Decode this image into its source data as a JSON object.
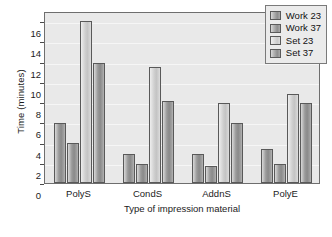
{
  "chart_data": {
    "type": "bar",
    "title": "",
    "xlabel": "Type of impression material",
    "ylabel": "Time (minutes)",
    "categories": [
      "PolyS",
      "CondS",
      "AddnS",
      "PolyE"
    ],
    "series": [
      {
        "name": "Work 23",
        "style": "dark",
        "values": [
          5.9,
          2.9,
          2.9,
          3.4
        ]
      },
      {
        "name": "Work 37",
        "style": "dark",
        "values": [
          4.0,
          1.9,
          1.7,
          1.9
        ]
      },
      {
        "name": "Set 23",
        "style": "light",
        "values": [
          16.0,
          11.5,
          7.9,
          8.8
        ]
      },
      {
        "name": "Set 37",
        "style": "dark",
        "values": [
          11.9,
          8.1,
          5.9,
          7.9
        ]
      }
    ],
    "ylim": [
      0,
      17
    ],
    "yticks": [
      0,
      2,
      4,
      6,
      8,
      10,
      12,
      14,
      16
    ],
    "ytick_labels": [
      "0",
      "2",
      "4",
      "6",
      "8",
      "10",
      "12",
      "14",
      "16"
    ],
    "grid": true,
    "legend_position": "top-right",
    "colors": {
      "plot_background": "#e9e9e9",
      "gridline": "#f6f6f6",
      "bar_dark": "#9a9a9a",
      "bar_light": "#cfcfcf",
      "bar_outline": "#595959",
      "axis": "#6e6e6e",
      "text": "#1b1b1b",
      "legend_background": "#ebebeb"
    }
  }
}
